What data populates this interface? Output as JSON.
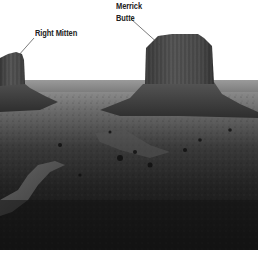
{
  "image": {
    "subject": "Monument Valley desert landscape, grayscale photograph",
    "background_color": "#ffffff",
    "sky_color": "#ffffff",
    "ground_dark": "#1a1a1a",
    "rock_color": "#4a4a4a"
  },
  "annotations": [
    {
      "label": "Right Mitten",
      "text_x": 34,
      "text_y": 29,
      "pointer_from": [
        34,
        40
      ],
      "pointer_to": [
        18,
        58
      ]
    },
    {
      "label_line1": "Merrick",
      "label_line2": "Butte",
      "text_x": 116,
      "text_y": 2,
      "pointer_from": [
        131,
        20
      ],
      "pointer_to": [
        160,
        46
      ]
    }
  ],
  "labels": {
    "right_mitten": "Right Mitten",
    "merrick_line1": "Merrick",
    "merrick_line2": "Butte"
  }
}
